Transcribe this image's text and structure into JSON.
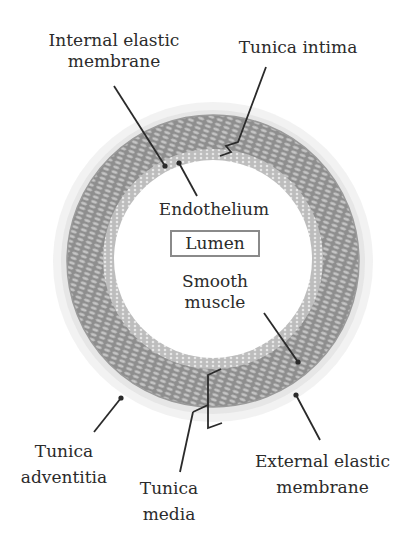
{
  "diagram": {
    "colors": {
      "background": "#ffffff",
      "media_ring": "#8c8c8c",
      "intima_ring": "#b5b5b5",
      "adventitia_ring": "#dcdcdc",
      "leader_line": "#2a2a2a",
      "lumen_box_border": "#8a8a8a",
      "text": "#2b2b2b"
    },
    "labels": {
      "internal_elastic_membrane": [
        "Internal elastic",
        "membrane"
      ],
      "tunica_intima": "Tunica intima",
      "endothelium": "Endothelium",
      "lumen": "Lumen",
      "smooth_muscle": [
        "Smooth",
        "muscle"
      ],
      "tunica_adventitia": [
        "Tunica",
        "adventitia"
      ],
      "tunica_media": [
        "Tunica",
        "media"
      ],
      "external_elastic_membrane": [
        "External elastic",
        "membrane"
      ]
    }
  }
}
